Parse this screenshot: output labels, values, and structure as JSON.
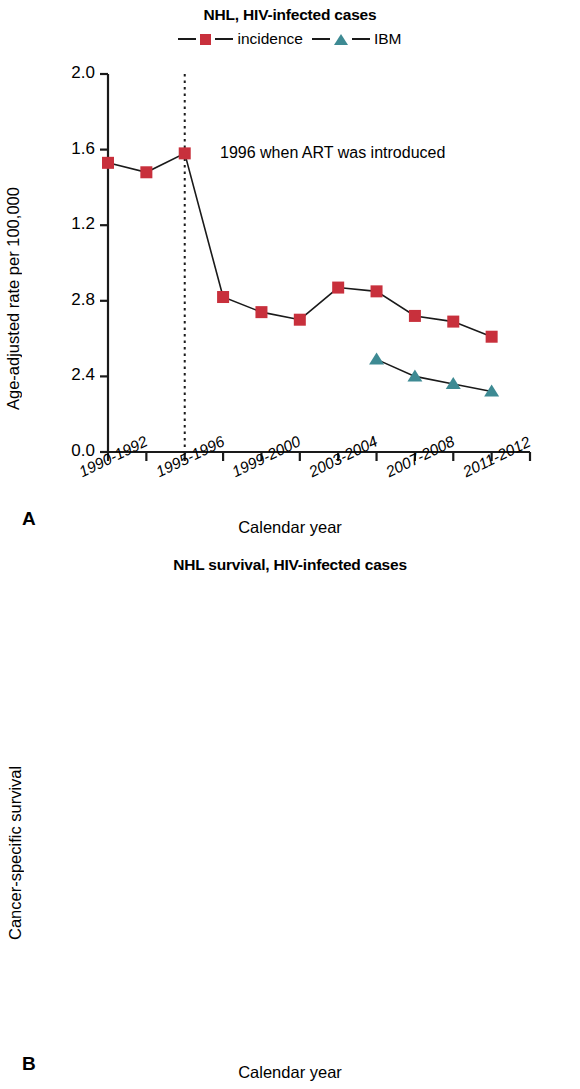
{
  "figure": {
    "panels": [
      {
        "letter": "A",
        "title": "NHL, HIV-infected cases",
        "annotation": "1996 when ART was introduced"
      },
      {
        "letter": "B",
        "title": "NHL survival, HIV-infected cases"
      }
    ]
  },
  "legend": {
    "entries": [
      {
        "label": "incidence",
        "marker": "square-marker",
        "color": "#c8303c"
      },
      {
        "label": "IBM",
        "marker": "triangle-marker",
        "color": "#3d8a93"
      }
    ]
  },
  "chart_data": [
    {
      "type": "line",
      "panel": "A",
      "title": "NHL, HIV-infected cases",
      "xlabel": "Calendar year",
      "ylabel": "Age-adjusted rate per 100,000",
      "grid": false,
      "legend_position": "top-center",
      "annotations": [
        {
          "text": "1996 when ART was introduced",
          "x_index": 3,
          "note": "dotted vertical reference line at 1995-1996"
        }
      ],
      "x": [
        "1990-1992",
        "1993-1994",
        "1995-1996",
        "1997-1998",
        "1999-2000",
        "2001-2002",
        "2003-2004",
        "2005-2006",
        "2007-2008",
        "2009-2010",
        "2011-2012"
      ],
      "xtick_labels": [
        "1990-1992",
        "1995-1996",
        "1999-2000",
        "2003-2004",
        "2007-2008",
        "2011-2012"
      ],
      "ytick_labels": [
        "2.0",
        "1.6",
        "1.2",
        "2.8",
        "2.4",
        "0.0"
      ],
      "ytick_values": [
        2.0,
        1.6,
        1.2,
        0.8,
        0.4,
        0.0
      ],
      "ylim": [
        0.0,
        2.0
      ],
      "series": [
        {
          "name": "incidence",
          "color": "#c8303c",
          "marker": "square",
          "values": [
            1.53,
            1.48,
            1.58,
            0.82,
            0.74,
            0.7,
            0.87,
            0.85,
            0.72,
            0.69,
            0.61
          ]
        },
        {
          "name": "IBM",
          "color": "#3d8a93",
          "marker": "triangle",
          "values": [
            null,
            null,
            null,
            null,
            null,
            null,
            null,
            0.49,
            0.4,
            0.36,
            0.32
          ]
        }
      ]
    },
    {
      "type": "line",
      "panel": "B",
      "title": "NHL survival, HIV-infected cases",
      "xlabel": "Calendar year",
      "ylabel": "Cancer-specific survival",
      "grid": false,
      "annotations": [
        {
          "text": "",
          "note": "dotted vertical reference line at 1995-1996"
        }
      ],
      "x": [
        "1990-1992",
        "1993-1994",
        "1995-1996",
        "1997-1998",
        "1999-2000",
        "2001-2002",
        "2003-2004",
        "2005-2006",
        "2007-2008"
      ],
      "xtick_labels": [
        "1990-1992",
        "1995-1996",
        "1999-2000",
        "2003-2004",
        "2007-2008",
        "2011-2012"
      ],
      "ytick_labels": [
        "100%",
        "80%",
        "60%",
        "40%",
        "20%",
        "0%"
      ],
      "ytick_values": [
        100,
        80,
        60,
        40,
        20,
        0
      ],
      "ylim": [
        0,
        100
      ],
      "series": [
        {
          "name": "cancer-specific survival",
          "color": "#7b7ba0",
          "marker": "circle",
          "values": [
            9,
            11.5,
            23,
            29.5,
            32,
            43,
            38.5,
            47.5,
            56
          ]
        }
      ]
    }
  ],
  "axis_titles": {
    "x": "Calendar year",
    "y_a": "Age-adjusted rate per 100,000",
    "y_b": "Cancer-specific survival"
  }
}
